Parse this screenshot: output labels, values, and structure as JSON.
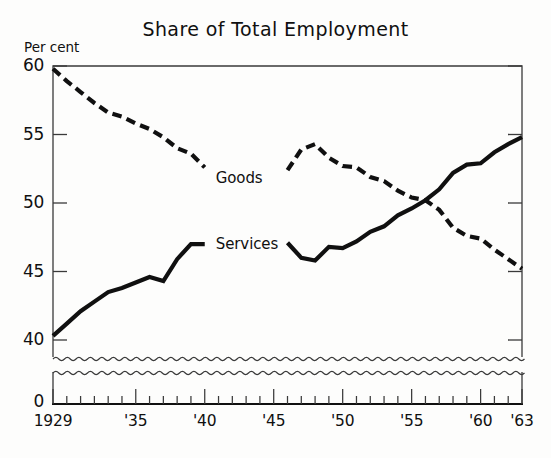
{
  "chart_data": {
    "type": "line",
    "title": "Share of Total Employment",
    "ylabel": "Per cent",
    "xlabel": "",
    "ylim": [
      40,
      60
    ],
    "xlim": [
      1929,
      1963
    ],
    "grid": false,
    "axis_break": true,
    "axis_break_note": "wavy break between 40 and 0",
    "y_ticks": [
      "60",
      "55",
      "50",
      "45",
      "40",
      "0"
    ],
    "y_tick_values": [
      60,
      55,
      50,
      45,
      40,
      0
    ],
    "x_ticks": [
      "1929",
      "'35",
      "'40",
      "'45",
      "'50",
      "'55",
      "'60",
      "'63"
    ],
    "x_tick_values": [
      1929,
      1935,
      1940,
      1945,
      1950,
      1955,
      1960,
      1963
    ],
    "minor_tick_interval_years": 1,
    "legend_position": "inline-annotation",
    "series": [
      {
        "name": "Goods",
        "style": "dashed",
        "color": "#101010",
        "x": [
          1929,
          1930,
          1931,
          1932,
          1933,
          1934,
          1935,
          1936,
          1937,
          1938,
          1939,
          1940,
          1946,
          1947,
          1948,
          1949,
          1950,
          1951,
          1952,
          1953,
          1954,
          1955,
          1956,
          1957,
          1958,
          1959,
          1960,
          1961,
          1962,
          1963
        ],
        "values": [
          59.8,
          58.9,
          58.1,
          57.3,
          56.6,
          56.3,
          55.8,
          55.4,
          54.8,
          54.0,
          53.6,
          52.6,
          52.4,
          53.9,
          54.3,
          53.3,
          52.7,
          52.6,
          51.9,
          51.6,
          50.9,
          50.4,
          50.2,
          49.5,
          48.2,
          47.6,
          47.4,
          46.6,
          45.9,
          45.2
        ]
      },
      {
        "name": "Services",
        "style": "solid",
        "color": "#101010",
        "x": [
          1929,
          1930,
          1931,
          1932,
          1933,
          1934,
          1935,
          1936,
          1937,
          1938,
          1939,
          1940,
          1946,
          1947,
          1948,
          1949,
          1950,
          1951,
          1952,
          1953,
          1954,
          1955,
          1956,
          1957,
          1958,
          1959,
          1960,
          1961,
          1962,
          1963
        ],
        "values": [
          40.3,
          41.2,
          42.1,
          42.8,
          43.5,
          43.8,
          44.2,
          44.6,
          44.3,
          45.9,
          47.0,
          47.0,
          47.1,
          46.0,
          45.8,
          46.8,
          46.7,
          47.2,
          47.9,
          48.3,
          49.1,
          49.6,
          50.2,
          51.0,
          52.2,
          52.8,
          52.9,
          53.7,
          54.3,
          54.8
        ]
      }
    ],
    "annotations": [
      {
        "text": "Goods",
        "x": 1940,
        "y": 52.6
      },
      {
        "text": "Services",
        "x": 1940,
        "y": 47.0
      }
    ]
  },
  "labels": {
    "goods": "Goods",
    "services": "Services"
  }
}
